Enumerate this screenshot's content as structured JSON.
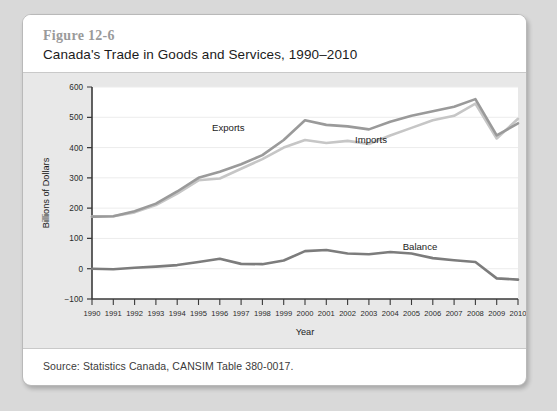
{
  "figure": {
    "number": "Figure 12-6",
    "title": "Canada's Trade in Goods and Services, 1990–2010",
    "source": "Source: Statistics Canada, CANSIM Table 380-0017."
  },
  "colors": {
    "page_background": "#d9d9d9",
    "card_background": "#ffffff",
    "plot_background": "#e8e8e8",
    "plot_area": "#ffffff",
    "exports_line": "#9a9a9a",
    "imports_line": "#c6c6c6",
    "balance_line": "#7c7c7c",
    "axis": "#3a3a3a",
    "gridline": "#ececec",
    "figure_number_text": "#9a9a9a"
  },
  "chart_data": {
    "type": "line",
    "title": "Canada's Trade in Goods and Services, 1990–2010",
    "xlabel": "Year",
    "ylabel": "Billions of Dollars",
    "x": [
      1990,
      1991,
      1992,
      1993,
      1994,
      1995,
      1996,
      1997,
      1998,
      1999,
      2000,
      2001,
      2002,
      2003,
      2004,
      2005,
      2006,
      2007,
      2008,
      2009,
      2010
    ],
    "xtick_labels": [
      "1990",
      "1991",
      "1992",
      "1993",
      "1994",
      "1995",
      "1996",
      "1997",
      "1998",
      "1999",
      "2000",
      "2001",
      "2002",
      "2003",
      "2004",
      "2005",
      "2006",
      "2007",
      "2008",
      "2009",
      "2010"
    ],
    "ytick_labels": [
      "600",
      "500",
      "400",
      "300",
      "200",
      "100",
      "0",
      "−100"
    ],
    "yticks": [
      600,
      500,
      400,
      300,
      200,
      100,
      0,
      -100
    ],
    "ylim": [
      -100,
      600
    ],
    "xlim": [
      1990,
      2010
    ],
    "grid": true,
    "legend": "inline-labels",
    "series": [
      {
        "name": "Exports",
        "color": "#9a9a9a",
        "label_x": 1996.4,
        "label_y": 455,
        "values": [
          172,
          173,
          190,
          215,
          255,
          300,
          320,
          345,
          375,
          425,
          490,
          475,
          470,
          460,
          485,
          505,
          520,
          535,
          560,
          440,
          480
        ]
      },
      {
        "name": "Imports",
        "color": "#c6c6c6",
        "label_x": 2003.1,
        "label_y": 415,
        "values": [
          172,
          173,
          186,
          210,
          248,
          292,
          298,
          330,
          362,
          400,
          425,
          415,
          422,
          412,
          440,
          465,
          490,
          505,
          545,
          430,
          495
        ]
      },
      {
        "name": "Balance",
        "color": "#7c7c7c",
        "label_x": 2005.4,
        "label_y": 62,
        "values": [
          0,
          -2,
          3,
          7,
          12,
          22,
          33,
          16,
          15,
          27,
          58,
          62,
          50,
          48,
          55,
          50,
          35,
          28,
          22,
          -32,
          -36
        ]
      }
    ]
  }
}
